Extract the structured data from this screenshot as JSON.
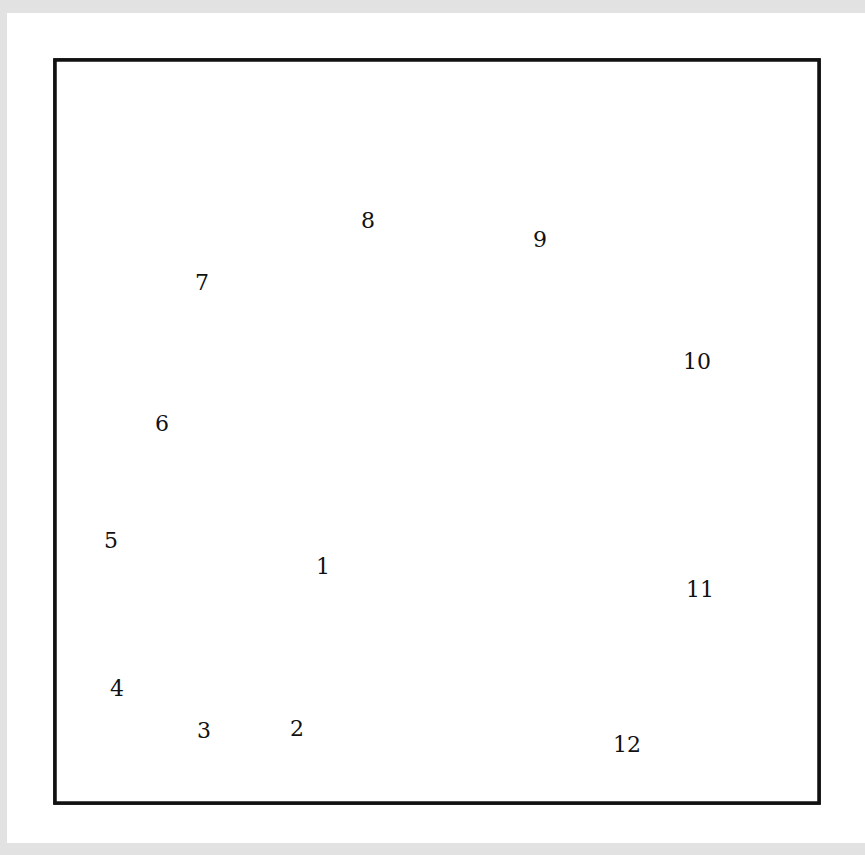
{
  "diagram": {
    "type": "paper-piecing-block",
    "frame": {
      "x": 55,
      "y": 60,
      "w": 764,
      "h": 743
    },
    "colors": {
      "background": "#e2e2e2",
      "page": "#ffffff",
      "line": "#111111"
    },
    "seams": [
      [
        [
          104,
          803
        ],
        [
          819,
          620
        ]
      ],
      [
        [
          308,
          749
        ],
        [
          819,
          433
        ]
      ],
      [
        [
          425,
          677
        ],
        [
          721,
          60
        ]
      ],
      [
        [
          459,
          604
        ],
        [
          436,
          60
        ]
      ],
      [
        [
          455,
          507
        ],
        [
          154,
          60
        ]
      ],
      [
        [
          406,
          438
        ],
        [
          55,
          332
        ]
      ],
      [
        [
          55,
          523
        ],
        [
          329,
          415
        ]
      ],
      [
        [
          55,
          660
        ],
        [
          250,
          448
        ]
      ],
      [
        [
          189,
          514
        ],
        [
          172,
          786
        ]
      ],
      [
        [
          183,
          609
        ],
        [
          282,
          757
        ]
      ],
      [
        [
          246,
          701
        ],
        [
          358,
          718
        ]
      ]
    ],
    "pieces": [
      {
        "id": "1",
        "x": 323,
        "y": 566
      },
      {
        "id": "2",
        "x": 297,
        "y": 728
      },
      {
        "id": "3",
        "x": 204,
        "y": 730
      },
      {
        "id": "4",
        "x": 117,
        "y": 688
      },
      {
        "id": "5",
        "x": 111,
        "y": 540
      },
      {
        "id": "6",
        "x": 162,
        "y": 423
      },
      {
        "id": "7",
        "x": 202,
        "y": 282
      },
      {
        "id": "8",
        "x": 368,
        "y": 220
      },
      {
        "id": "9",
        "x": 540,
        "y": 239
      },
      {
        "id": "10",
        "x": 697,
        "y": 361
      },
      {
        "id": "11",
        "x": 700,
        "y": 589
      },
      {
        "id": "12",
        "x": 627,
        "y": 744
      }
    ]
  }
}
